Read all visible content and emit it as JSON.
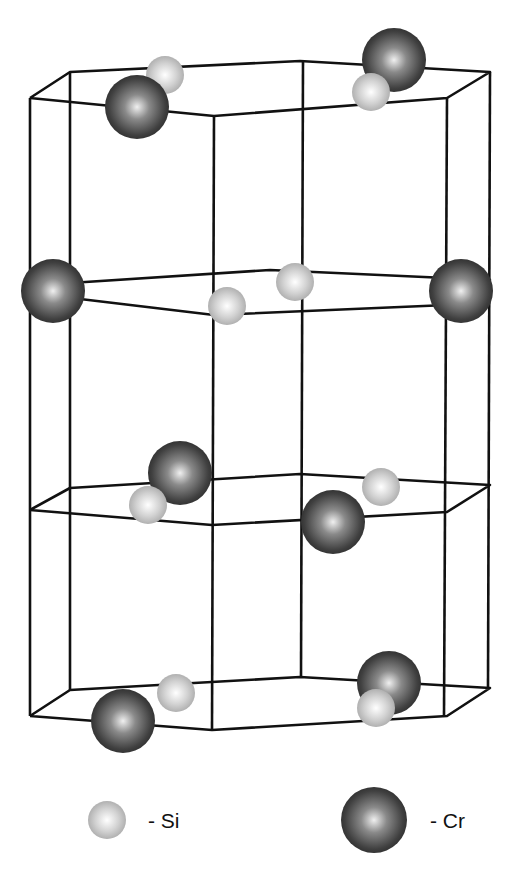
{
  "figure": {
    "legend": [
      {
        "symbol": "small-light-sphere",
        "label": "- Si",
        "color": "#c8c8c8"
      },
      {
        "symbol": "large-dark-sphere",
        "label": "- Cr",
        "color": "#3a3a3a"
      }
    ],
    "colors": {
      "si": "#c4c4c4",
      "cr": "#3c3c3c",
      "lines": "#111111",
      "background": "#ffffff"
    }
  }
}
